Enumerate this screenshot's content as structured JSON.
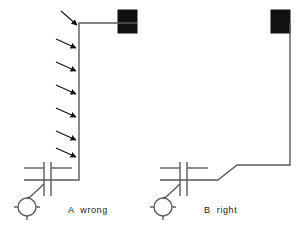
{
  "figure": {
    "background_color": "#ffffff",
    "line_color": "#5a5a5a",
    "block_color": "#111111",
    "arrow_color": "#111111",
    "text_color": "#1a1a1a",
    "width": 303,
    "height": 244
  },
  "panels": [
    {
      "id": "A",
      "caption": "A  wrong",
      "caption_letter": "A",
      "caption_word": "wrong",
      "description": "Vertical riser cable run with perpendicular interference arrows",
      "arrow_count": 7,
      "elements": {
        "device_block_label": "device-block",
        "machine_symbol_label": "machine-circle",
        "switch_symbol_label": "disconnect-switch"
      }
    },
    {
      "id": "B",
      "caption": "B  right",
      "caption_letter": "B",
      "caption_word": "right",
      "description": "Stepped horizontal cable run with no interference arrows",
      "arrow_count": 0,
      "elements": {
        "device_block_label": "device-block",
        "machine_symbol_label": "machine-circle",
        "switch_symbol_label": "disconnect-switch"
      }
    }
  ],
  "geometry": {
    "panel_a": {
      "block": {
        "x": 118,
        "y": 10,
        "w": 19,
        "h": 23
      },
      "wire_path": "M 137 23 L 79 23 L 79 180 L 24 180",
      "arrows_side_y": [
        45,
        68,
        91,
        114,
        137,
        155
      ],
      "arrow_top": {
        "x1": 60,
        "y1": 12,
        "x2": 78,
        "y2": 26
      },
      "machine_center": {
        "cx": 27,
        "cy": 207,
        "r": 9
      },
      "switch_bars_x": [
        44,
        51
      ]
    },
    "panel_b": {
      "block": {
        "x": 271,
        "y": 10,
        "w": 19,
        "h": 23
      },
      "wire_path": "M 290 23 L 290 165 L 237 165 L 218 180 L 160 180",
      "machine_center": {
        "cx": 163,
        "cy": 207,
        "r": 9
      },
      "switch_bars_x": [
        180,
        187
      ]
    }
  }
}
